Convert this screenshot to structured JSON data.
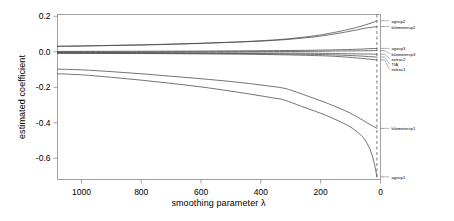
{
  "chart_data": {
    "type": "line",
    "title": "",
    "xlabel": "smoothing parameter λ",
    "ylabel": "estimated coefficient",
    "xlim": [
      1080,
      0
    ],
    "ylim": [
      -0.72,
      0.21
    ],
    "x_reversed": true,
    "grid": false,
    "legend_position": "right-axis-labels",
    "xticks": [
      1000,
      800,
      600,
      400,
      200,
      0
    ],
    "xtick_labels": [
      "1000",
      "800",
      "600",
      "400",
      "200",
      "0"
    ],
    "yticks": [
      0.2,
      0.0,
      -0.2,
      -0.4,
      -0.6
    ],
    "ytick_labels": [
      "0.2",
      "0.0",
      "-0.2",
      "-0.4",
      "-0.6"
    ],
    "annotations": [
      {
        "name": "vertical-dashed-line",
        "x": 12,
        "style": "dashed",
        "color": "#555555"
      }
    ],
    "series": [
      {
        "name": "agecp2",
        "label": "agecp2",
        "color": "#444444",
        "end_value": 0.175,
        "x": [
          1080,
          1000,
          900,
          800,
          700,
          600,
          500,
          400,
          330,
          280,
          220,
          170,
          120,
          80,
          50,
          30,
          12
        ],
        "y": [
          0.031,
          0.033,
          0.036,
          0.039,
          0.043,
          0.048,
          0.054,
          0.062,
          0.07,
          0.078,
          0.09,
          0.104,
          0.121,
          0.137,
          0.152,
          0.163,
          0.175
        ]
      },
      {
        "name": "kilometercp2",
        "label": "kilometercp2",
        "color": "#444444",
        "end_value": 0.142,
        "x": [
          1080,
          1000,
          900,
          800,
          700,
          600,
          500,
          400,
          330,
          280,
          220,
          170,
          120,
          80,
          50,
          30,
          12
        ],
        "y": [
          0.03,
          0.032,
          0.035,
          0.038,
          0.042,
          0.047,
          0.053,
          0.06,
          0.067,
          0.074,
          0.084,
          0.096,
          0.11,
          0.123,
          0.133,
          0.138,
          0.142
        ]
      },
      {
        "name": "agecp3",
        "label": "agecp3",
        "color": "#444444",
        "end_value": 0.019,
        "x": [
          1080,
          800,
          600,
          400,
          250,
          150,
          80,
          40,
          12
        ],
        "y": [
          0.002,
          0.003,
          0.004,
          0.006,
          0.008,
          0.011,
          0.014,
          0.017,
          0.019
        ]
      },
      {
        "name": "kilometercp3",
        "label": "kilometercp3",
        "color": "#444444",
        "end_value": 0.007,
        "x": [
          1080,
          800,
          600,
          400,
          250,
          150,
          80,
          40,
          12
        ],
        "y": [
          -0.001,
          -0.001,
          0.0,
          0.001,
          0.002,
          0.004,
          0.005,
          0.006,
          0.007
        ]
      },
      {
        "name": "extras2",
        "label": "extras2",
        "color": "#444444",
        "end_value": -0.014,
        "x": [
          1080,
          800,
          600,
          400,
          250,
          150,
          80,
          40,
          12
        ],
        "y": [
          -0.005,
          -0.005,
          -0.006,
          -0.007,
          -0.008,
          -0.01,
          -0.012,
          -0.013,
          -0.014
        ]
      },
      {
        "name": "TIA",
        "label": "TIA",
        "color": "#444444",
        "end_value": -0.03,
        "x": [
          1080,
          800,
          600,
          400,
          250,
          150,
          80,
          40,
          12
        ],
        "y": [
          -0.007,
          -0.008,
          -0.009,
          -0.011,
          -0.014,
          -0.018,
          -0.023,
          -0.027,
          -0.03
        ]
      },
      {
        "name": "extras1",
        "label": "extras1",
        "color": "#444444",
        "end_value": -0.046,
        "x": [
          1080,
          800,
          600,
          400,
          250,
          150,
          80,
          40,
          12
        ],
        "y": [
          -0.009,
          -0.01,
          -0.012,
          -0.015,
          -0.02,
          -0.026,
          -0.035,
          -0.041,
          -0.046
        ]
      },
      {
        "name": "kilometercp1",
        "label": "kilometercp1",
        "color": "#444444",
        "end_value": -0.432,
        "x": [
          1080,
          1000,
          900,
          800,
          700,
          600,
          500,
          420,
          360,
          330,
          300,
          260,
          220,
          180,
          140,
          100,
          60,
          30,
          12
        ],
        "y": [
          -0.098,
          -0.102,
          -0.112,
          -0.124,
          -0.138,
          -0.152,
          -0.168,
          -0.183,
          -0.196,
          -0.203,
          -0.216,
          -0.24,
          -0.264,
          -0.289,
          -0.316,
          -0.347,
          -0.385,
          -0.415,
          -0.432
        ]
      },
      {
        "name": "agecp1",
        "label": "agecp1",
        "color": "#444444",
        "end_value": -0.705,
        "x": [
          1080,
          1000,
          900,
          800,
          700,
          600,
          500,
          420,
          360,
          330,
          300,
          260,
          220,
          180,
          140,
          110,
          80,
          55,
          35,
          22,
          12
        ],
        "y": [
          -0.124,
          -0.13,
          -0.144,
          -0.16,
          -0.178,
          -0.198,
          -0.222,
          -0.243,
          -0.26,
          -0.268,
          -0.285,
          -0.31,
          -0.334,
          -0.36,
          -0.39,
          -0.415,
          -0.448,
          -0.49,
          -0.55,
          -0.62,
          -0.705
        ]
      }
    ]
  },
  "axis_labels": {
    "right_labels": [
      {
        "name": "agecp2",
        "value": 0.175
      },
      {
        "name": "kilometercp2",
        "value": 0.142
      },
      {
        "name": "agecp3",
        "value": 0.019
      },
      {
        "name": "kilometercp3",
        "value": 0.007
      },
      {
        "name": "extras2",
        "value": -0.014
      },
      {
        "name": "TIA",
        "value": -0.03
      },
      {
        "name": "extras1",
        "value": -0.046
      },
      {
        "name": "kilometercp1",
        "value": -0.432
      },
      {
        "name": "agecp1",
        "value": -0.705
      }
    ]
  }
}
